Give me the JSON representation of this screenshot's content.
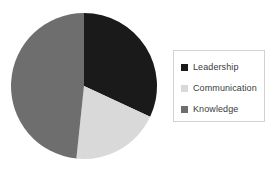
{
  "chart_data": {
    "type": "pie",
    "title": "",
    "subtitle": "",
    "xlabel": "",
    "ylabel": "",
    "grid": false,
    "legend_position": "right",
    "start_angle_deg": 0,
    "direction": "clockwise",
    "categories": [
      "Leadership",
      "Communication",
      "Knowledge"
    ],
    "values": [
      32,
      20,
      48
    ],
    "value_unit": "percent",
    "colors": [
      "#1a1a1a",
      "#d9d9d9",
      "#6e6e6e"
    ],
    "slices": [
      {
        "label": "Leadership",
        "value": 32,
        "color": "#1a1a1a",
        "start_deg": 0,
        "end_deg": 115
      },
      {
        "label": "Communication",
        "value": 20,
        "color": "#d9d9d9",
        "start_deg": 115,
        "end_deg": 186
      },
      {
        "label": "Knowledge",
        "value": 48,
        "color": "#6e6e6e",
        "start_deg": 186,
        "end_deg": 360
      }
    ],
    "annotations": []
  },
  "legend": {
    "border_color": "#d2d2d2",
    "background": "#ffffff",
    "items": [
      {
        "label": "Leadership",
        "color": "#1a1a1a",
        "swatch_name": "legend-swatch-leadership"
      },
      {
        "label": "Communication",
        "color": "#d9d9d9",
        "swatch_name": "legend-swatch-communication"
      },
      {
        "label": "Knowledge",
        "color": "#6e6e6e",
        "swatch_name": "legend-swatch-knowledge"
      }
    ]
  },
  "canvas": {
    "background": "#ffffff",
    "pie_center_x": 74,
    "pie_center_y": 74,
    "pie_radius": 73
  }
}
